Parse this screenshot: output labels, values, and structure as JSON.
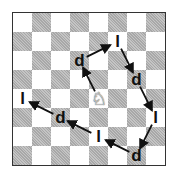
{
  "board": {
    "files": [
      "a",
      "b",
      "c",
      "d",
      "e",
      "f",
      "g",
      "h"
    ],
    "ranks": [
      8,
      7,
      6,
      5,
      4,
      3,
      2,
      1
    ],
    "top_left_color": "light"
  },
  "knight": {
    "square": "e4",
    "piece": "white-knight",
    "glyph": "♘"
  },
  "tour": [
    {
      "square": "d6",
      "label": "d"
    },
    {
      "square": "f7",
      "label": "l"
    },
    {
      "square": "g5",
      "label": "d"
    },
    {
      "square": "h3",
      "label": "l"
    },
    {
      "square": "g1",
      "label": "d"
    },
    {
      "square": "e2",
      "label": "l"
    },
    {
      "square": "c3",
      "label": "d"
    },
    {
      "square": "a4",
      "label": "l"
    }
  ],
  "colors": {
    "dark_square": "#b4b4b4",
    "light_square": "#ffffff",
    "arrow": "#111111",
    "border": "#333333"
  }
}
